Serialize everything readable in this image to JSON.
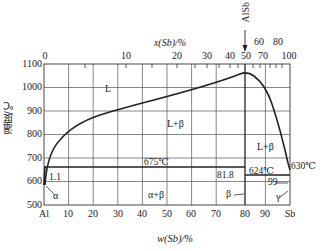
{
  "diagram": {
    "x_axis_bottom": {
      "label": "w(Sb)/%",
      "ticks": [
        "Al",
        "10",
        "20",
        "30",
        "40",
        "50",
        "60",
        "70",
        "80",
        "90",
        "Sb"
      ]
    },
    "x_axis_top": {
      "label": "x(Sb)/%",
      "ticks": [
        "0",
        "10",
        "20",
        "30",
        "40",
        "50",
        "60",
        "70",
        "80",
        "100"
      ],
      "upper_ticks": [
        "60",
        "80"
      ],
      "compound_marker": "AlSb"
    },
    "y_axis": {
      "label": "温度/℃",
      "ticks": [
        "1100",
        "1000",
        "900",
        "800",
        "700",
        "600",
        "500"
      ]
    },
    "regions": {
      "liquid": "L",
      "liquid_beta_left": "L+β",
      "liquid_beta_right": "L+β",
      "alpha_beta": "α+β",
      "alpha": "α",
      "beta": "β",
      "gamma": "γ"
    },
    "annotations": {
      "eutectic_left_temp": "675℃",
      "eutectic_right_temp": "624℃",
      "sb_melting": "630℃",
      "alpha_solubility": "1.1",
      "eutectic_left_comp": "81.8",
      "gamma_comp": "99"
    }
  }
}
